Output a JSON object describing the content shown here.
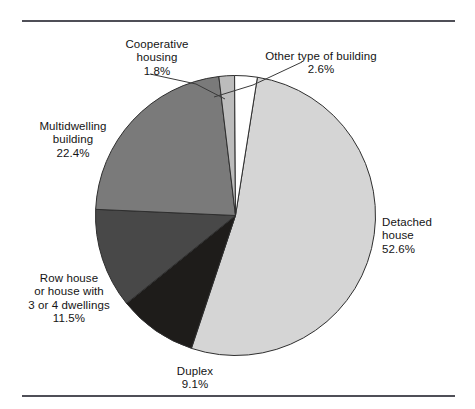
{
  "figure": {
    "background": "#ffffff",
    "rule_color": "#4f4f57"
  },
  "chart_data": {
    "type": "pie",
    "title": "",
    "subtitle": "",
    "xlabel": "",
    "ylabel": "",
    "legend_position": "none",
    "labels_position": "outside",
    "units": "percent",
    "start_angle_deg": 9,
    "direction": "clockwise",
    "categories": [
      "Detached house",
      "Duplex",
      "Row house or house with 3 or 4 dwellings",
      "Multidwelling building",
      "Cooperative housing",
      "Other type of building"
    ],
    "values": [
      52.6,
      9.1,
      11.5,
      22.4,
      1.8,
      2.6
    ],
    "colors": [
      "#d5d5d5",
      "#1e1c1a",
      "#484848",
      "#7a7a7a",
      "#bcbcbc",
      "#ffffff"
    ],
    "slices": [
      {
        "name": "Detached house",
        "value": 52.6,
        "value_text": "52.6%",
        "color": "#d5d5d5",
        "label_lines": [
          "Detached",
          "house"
        ],
        "has_leader_line": false
      },
      {
        "name": "Duplex",
        "value": 9.1,
        "value_text": "9.1%",
        "color": "#1e1c1a",
        "label_lines": [
          "Duplex"
        ],
        "has_leader_line": false
      },
      {
        "name": "Row house or house with 3 or 4 dwellings",
        "value": 11.5,
        "value_text": "11.5%",
        "color": "#484848",
        "label_lines": [
          "Row house",
          "or house with",
          "3 or 4 dwellings"
        ],
        "has_leader_line": false
      },
      {
        "name": "Multidwelling building",
        "value": 22.4,
        "value_text": "22.4%",
        "color": "#7a7a7a",
        "label_lines": [
          "Multidwelling",
          "building"
        ],
        "has_leader_line": false
      },
      {
        "name": "Cooperative housing",
        "value": 1.8,
        "value_text": "1.8%",
        "color": "#bcbcbc",
        "label_lines": [
          "Cooperative",
          "housing"
        ],
        "has_leader_line": true
      },
      {
        "name": "Other type of building",
        "value": 2.6,
        "value_text": "2.6%",
        "color": "#ffffff",
        "label_lines": [
          "Other type of building"
        ],
        "has_leader_line": true
      }
    ]
  },
  "labels": {
    "cooperative": {
      "text": "Cooperative\nhousing",
      "percent": "1.8%"
    },
    "other": {
      "text": "Other type of building",
      "percent": "2.6%"
    },
    "multidwelling": {
      "text": "Multidwelling\nbuilding",
      "percent": "22.4%"
    },
    "rowhouse": {
      "text": "Row house\nor house with\n3 or 4 dwellings",
      "percent": "11.5%"
    },
    "duplex": {
      "text": "Duplex",
      "percent": "9.1%"
    },
    "detached": {
      "text": "Detached\nhouse",
      "percent": "52.6%"
    }
  }
}
